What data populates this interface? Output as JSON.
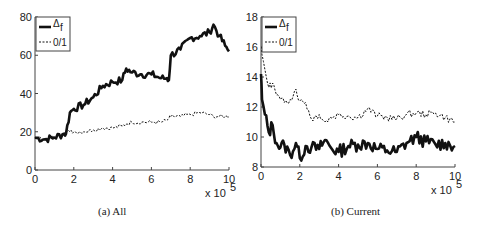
{
  "chart_data": [
    {
      "type": "line",
      "title": "(a) All",
      "xlabel": "",
      "ylabel": "",
      "x_multiplier_label": "x 10",
      "x_multiplier_exp": "5",
      "xlim": [
        0,
        10
      ],
      "ylim": [
        0,
        80
      ],
      "xticks": [
        "0",
        "2",
        "4",
        "6",
        "8",
        "10"
      ],
      "yticks": [
        "0",
        "20",
        "40",
        "60",
        "80"
      ],
      "grid": false,
      "legend_position": "upper left",
      "x": [
        0,
        0.5,
        1.0,
        1.5,
        1.6,
        1.8,
        2.0,
        2.5,
        3.0,
        3.5,
        4.0,
        4.5,
        4.7,
        5.0,
        5.5,
        6.0,
        6.5,
        6.8,
        6.9,
        7.0,
        7.5,
        8.0,
        8.5,
        9.0,
        9.2,
        9.5,
        9.8,
        10.0
      ],
      "series": [
        {
          "name": "Δf",
          "style": "solid-thick",
          "values": [
            17,
            16,
            17,
            19,
            19,
            30,
            32,
            34,
            38,
            44,
            46,
            47,
            53,
            51,
            50,
            50,
            48,
            48,
            47,
            60,
            63,
            69,
            70,
            72,
            76,
            70,
            65,
            62
          ]
        },
        {
          "name": "0/1",
          "style": "dashed",
          "values": [
            17,
            16,
            17,
            19,
            20,
            20,
            20,
            20,
            21,
            22,
            22,
            23,
            24,
            25,
            25,
            25,
            25,
            26,
            27,
            28,
            28,
            29,
            30,
            29,
            28,
            28,
            28,
            28
          ]
        }
      ]
    },
    {
      "type": "line",
      "title": "(b) Current",
      "xlabel": "",
      "ylabel": "",
      "x_multiplier_label": "x 10",
      "x_multiplier_exp": "5",
      "xlim": [
        0,
        10
      ],
      "ylim": [
        8,
        18
      ],
      "xticks": [
        "0",
        "2",
        "4",
        "6",
        "8",
        "10"
      ],
      "yticks": [
        "8",
        "10",
        "12",
        "14",
        "16",
        "18"
      ],
      "grid": false,
      "legend_position": "upper left",
      "x": [
        0,
        0.05,
        0.2,
        0.4,
        0.6,
        0.8,
        1.0,
        1.2,
        1.5,
        1.8,
        2.0,
        2.3,
        2.6,
        3.0,
        3.3,
        3.6,
        4.0,
        4.5,
        5.0,
        5.5,
        6.0,
        6.5,
        7.0,
        7.5,
        8.0,
        8.5,
        9.0,
        9.5,
        10.0
      ],
      "series": [
        {
          "name": "Δf",
          "style": "solid-thick",
          "values": [
            14.2,
            12.5,
            11.5,
            10.3,
            10.8,
            9.6,
            9.3,
            9.5,
            8.8,
            9.6,
            8.6,
            9.4,
            9.3,
            9.2,
            9.8,
            9.3,
            9.0,
            9.4,
            9.5,
            9.6,
            9.2,
            9.1,
            9.0,
            9.6,
            10.0,
            9.7,
            9.5,
            9.6,
            9.4
          ]
        },
        {
          "name": "0/1",
          "style": "dashed",
          "values": [
            16.0,
            15.5,
            14.5,
            13.3,
            13.6,
            12.8,
            12.5,
            12.3,
            12.5,
            13.2,
            12.4,
            12.3,
            11.2,
            11.5,
            11.0,
            11.3,
            11.5,
            11.4,
            11.3,
            11.9,
            11.4,
            11.3,
            11.2,
            11.5,
            11.6,
            11.5,
            11.6,
            11.3,
            11.0
          ]
        }
      ]
    }
  ],
  "panels": {
    "a": {
      "caption": "(a) All"
    },
    "b": {
      "caption": "(b) Current"
    }
  },
  "legend": {
    "items": [
      {
        "label": "Δ",
        "subscript": "f"
      },
      {
        "label": "0/1"
      }
    ]
  },
  "colors": {
    "line": "#111111",
    "axis": "#444444",
    "text": "#222222"
  }
}
